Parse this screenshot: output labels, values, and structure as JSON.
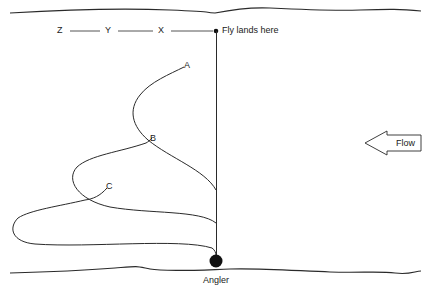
{
  "diagram": {
    "line_labels": {
      "z": "Z",
      "y": "Y",
      "x": "X"
    },
    "fly_label": "Fly lands here",
    "point_labels": {
      "a": "A",
      "b": "B",
      "c": "C"
    },
    "angler_label": "Angler",
    "flow_label": "Flow",
    "colors": {
      "stroke": "#2a2a2a",
      "background": "#ffffff"
    }
  }
}
